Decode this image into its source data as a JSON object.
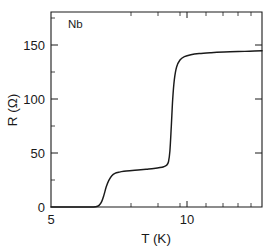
{
  "figure": {
    "background_color": "#ffffff",
    "line_color": "#1a1a1a",
    "sample_annotation": "Nb"
  },
  "axes": {
    "x_axis_title": "T (K)",
    "y_axis_title": "R (Ω)",
    "x_tick_labels": [
      "5",
      "10"
    ],
    "y_tick_labels": [
      "0",
      "50",
      "100",
      "150"
    ]
  },
  "chart_data": {
    "type": "line",
    "title": "",
    "subtitle": "",
    "annotations": [
      "Nb"
    ],
    "xlabel": "T (K)",
    "ylabel": "R (Ω)",
    "xscale": "log",
    "yscale": "linear",
    "xlim": [
      5,
      13.8
    ],
    "ylim": [
      0,
      181
    ],
    "grid": false,
    "legend": null,
    "x_ticks_major": [
      5,
      10
    ],
    "x_ticks_minor": [
      6,
      7,
      8,
      9,
      11,
      12,
      13
    ],
    "y_ticks_major": [
      0,
      50,
      100,
      150
    ],
    "y_ticks_minor": [
      25,
      75,
      125,
      175
    ],
    "series": [
      {
        "name": "Nb resistance",
        "x": [
          5.0,
          5.6,
          6.0,
          6.2,
          6.3,
          6.38,
          6.45,
          6.52,
          6.6,
          6.7,
          6.8,
          6.95,
          7.1,
          7.3,
          7.6,
          7.9,
          8.2,
          8.45,
          8.6,
          8.72,
          8.8,
          8.86,
          8.92,
          8.98,
          9.05,
          9.15,
          9.3,
          9.5,
          9.8,
          10.2,
          10.8,
          11.5,
          12.3,
          13.0,
          13.8
        ],
        "y": [
          0.0,
          0.0,
          0.0,
          0.3,
          1.5,
          5.0,
          11.0,
          18.5,
          24.5,
          29.0,
          31.2,
          32.4,
          33.1,
          33.7,
          34.4,
          35.1,
          35.8,
          36.6,
          37.4,
          38.8,
          42.0,
          52.0,
          75.0,
          100.0,
          118.0,
          130.0,
          136.5,
          139.5,
          141.3,
          142.4,
          143.2,
          143.8,
          144.3,
          144.6,
          145.0
        ]
      }
    ]
  }
}
